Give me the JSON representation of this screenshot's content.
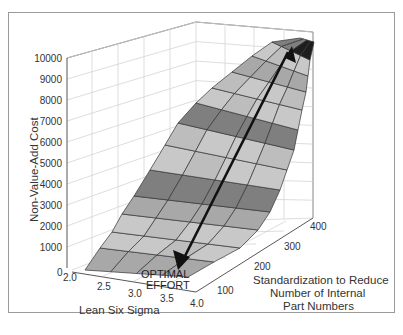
{
  "chart_data": {
    "type": "surface3d",
    "title": "",
    "xlabel": "Lean Six Sigma",
    "ylabel": "Standardization to Reduce Number of Internal Part Numbers",
    "zlabel": "Non-Value-Add Cost",
    "x_ticks": [
      "2.0",
      "2.5",
      "3.0",
      "3.5",
      "4.0"
    ],
    "y_ticks": [
      "100",
      "200",
      "300",
      "400"
    ],
    "z_ticks": [
      "0",
      "1000",
      "2000",
      "3000",
      "4000",
      "5000",
      "6000",
      "7000",
      "8000",
      "9000",
      "10000"
    ],
    "xlim": [
      2.0,
      4.0
    ],
    "ylim": [
      0,
      400
    ],
    "zlim": [
      0,
      10000
    ],
    "grid": true,
    "legend": null,
    "surface_description": "Cost surface rising from ~1000 at low Lean Six Sigma / low standardization to ~10000 at high standardization; shaded in alternating gray bands",
    "annotation": {
      "text_line1": "OPTIMAL",
      "text_line2": "EFFORT",
      "arrow": "from high-cost corner (top right) down to optimal point near floor (x≈3.5, y≈100)"
    }
  },
  "labels": {
    "z_axis": "Non-Value-Add Cost",
    "x_axis": "Lean Six Sigma",
    "y_axis_line1": "Standardization to Reduce",
    "y_axis_line2": "Number of Internal",
    "y_axis_line3": "Part Numbers",
    "optimal_line1": "OPTIMAL",
    "optimal_line2": "EFFORT"
  },
  "colors": {
    "light_band": "#c8c8c8",
    "mid_band": "#a8a8a8",
    "dark_band": "#7f7f7f",
    "peak": "#1e1e1e",
    "grid": "#d2d2d2",
    "axis": "#444444",
    "arrow": "#111111"
  }
}
